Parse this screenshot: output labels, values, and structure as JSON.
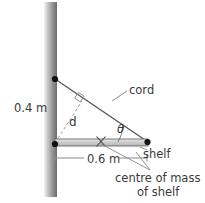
{
  "figure": {
    "labels": {
      "wall_height_dim": "0.4 m",
      "shelf_length_dim": "0.6 m",
      "cord": "cord",
      "perpendicular_distance": "d",
      "angle": "θ",
      "shelf": "shelf",
      "centre_of_mass_line1": "centre of mass",
      "centre_of_mass_line2": "of shelf"
    },
    "colors": {
      "wall_light": "#f2f2f2",
      "wall_mid": "#9a9a9a",
      "wall_dark": "#6e6e6e",
      "shelf_fill": "#c9c9c9",
      "shelf_stroke": "#555555",
      "line": "#555555",
      "dashed_line": "#9b9b9b",
      "text": "#3a3a3a",
      "dot": "#111111"
    },
    "geometry": {
      "wall_x_left": 44,
      "wall_x_right": 57,
      "wall_y_top": 2,
      "wall_y_bottom": 197,
      "top_anchor": [
        55,
        79
      ],
      "hinge": [
        55,
        143
      ],
      "shelf_right_end": [
        148,
        142
      ],
      "shelf_top_y": 139,
      "shelf_bottom_y": 146,
      "centre_of_mass_mark": [
        101,
        141
      ],
      "right_angle_mark": [
        78,
        97
      ],
      "dim_line_y": 158
    }
  }
}
